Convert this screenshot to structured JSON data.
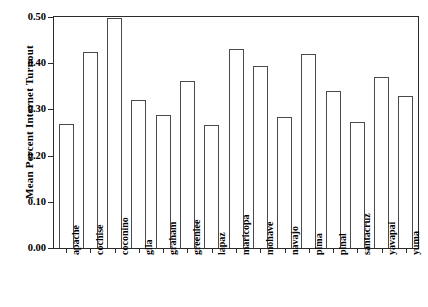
{
  "chart_data": {
    "type": "bar",
    "title": "",
    "xlabel": "",
    "ylabel": "Mean Percent Internet Turnout",
    "ylim": [
      0.0,
      0.5
    ],
    "yticks": [
      "0.00",
      "0.10",
      "0.20",
      "0.30",
      "0.40",
      "0.50"
    ],
    "ytick_values": [
      0.0,
      0.1,
      0.2,
      0.3,
      0.4,
      0.5
    ],
    "grid": false,
    "legend": null,
    "categories": [
      "apache",
      "cochise",
      "coconino",
      "gila",
      "graham",
      "greenlee",
      "lapaz",
      "maricopa",
      "mohave",
      "navajo",
      "pima",
      "pinal",
      "santacruz",
      "yavapai",
      "yuma"
    ],
    "values": [
      0.269,
      0.424,
      0.498,
      0.32,
      0.287,
      0.362,
      0.267,
      0.431,
      0.393,
      0.284,
      0.419,
      0.34,
      0.273,
      0.371,
      0.33
    ],
    "bar_color": "#ffffff",
    "bar_edge_color": "#4a4a4a",
    "axis_color": "#2b2b2b"
  }
}
